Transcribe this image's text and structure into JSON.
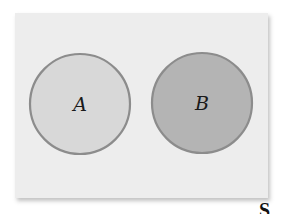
{
  "diagram": {
    "type": "venn",
    "sample_space": {
      "label": "S",
      "fill": "#ededed"
    },
    "sets": [
      {
        "label": "A",
        "cx": 80,
        "cy": 104,
        "r": 50,
        "fill": "#d8d8d8",
        "stroke": "#8c8c8c"
      },
      {
        "label": "B",
        "cx": 202,
        "cy": 103,
        "r": 50,
        "fill": "#b4b4b4",
        "stroke": "#8c8c8c"
      }
    ],
    "overlap": "none"
  }
}
